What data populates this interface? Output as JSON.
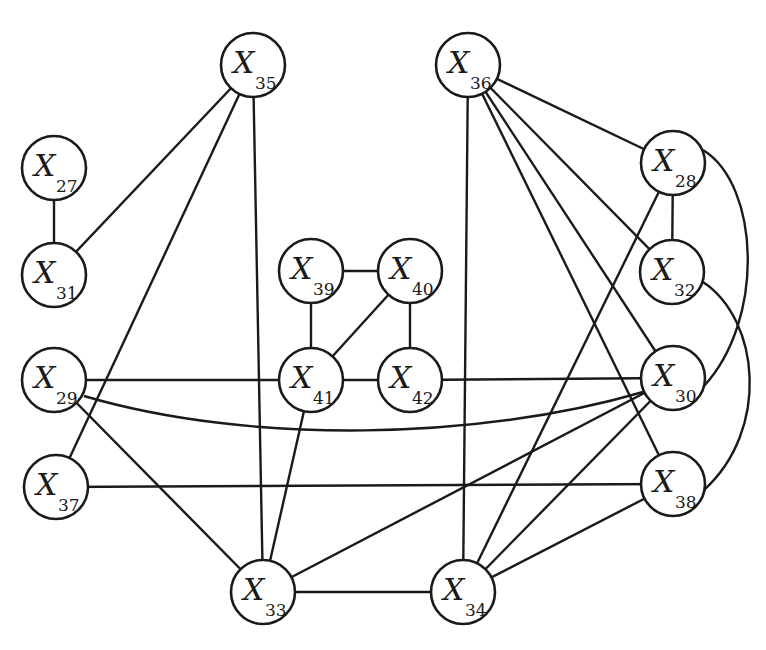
{
  "diagram": {
    "type": "undirected-graph",
    "node_radius": 32,
    "colors": {
      "stroke": "#1a1a1a",
      "fill": "#ffffff",
      "background": "#ffffff"
    },
    "nodes": [
      {
        "id": "X35",
        "var": "X",
        "sub": "35",
        "x": 253,
        "y": 65
      },
      {
        "id": "X36",
        "var": "X",
        "sub": "36",
        "x": 468,
        "y": 65
      },
      {
        "id": "X27",
        "var": "X",
        "sub": "27",
        "x": 54,
        "y": 168
      },
      {
        "id": "X28",
        "var": "X",
        "sub": "28",
        "x": 673,
        "y": 163
      },
      {
        "id": "X31",
        "var": "X",
        "sub": "31",
        "x": 54,
        "y": 275
      },
      {
        "id": "X32",
        "var": "X",
        "sub": "32",
        "x": 672,
        "y": 272
      },
      {
        "id": "X39",
        "var": "X",
        "sub": "39",
        "x": 311,
        "y": 271
      },
      {
        "id": "X40",
        "var": "X",
        "sub": "40",
        "x": 410,
        "y": 271
      },
      {
        "id": "X29",
        "var": "X",
        "sub": "29",
        "x": 54,
        "y": 380
      },
      {
        "id": "X41",
        "var": "X",
        "sub": "41",
        "x": 311,
        "y": 380
      },
      {
        "id": "X42",
        "var": "X",
        "sub": "42",
        "x": 410,
        "y": 380
      },
      {
        "id": "X30",
        "var": "X",
        "sub": "30",
        "x": 673,
        "y": 378
      },
      {
        "id": "X37",
        "var": "X",
        "sub": "37",
        "x": 56,
        "y": 487
      },
      {
        "id": "X38",
        "var": "X",
        "sub": "38",
        "x": 673,
        "y": 484
      },
      {
        "id": "X33",
        "var": "X",
        "sub": "33",
        "x": 263,
        "y": 592
      },
      {
        "id": "X34",
        "var": "X",
        "sub": "34",
        "x": 463,
        "y": 592
      }
    ],
    "edges": [
      {
        "from": "X27",
        "to": "X31"
      },
      {
        "from": "X35",
        "to": "X31"
      },
      {
        "from": "X35",
        "to": "X37"
      },
      {
        "from": "X35",
        "to": "X33"
      },
      {
        "from": "X36",
        "to": "X34"
      },
      {
        "from": "X36",
        "to": "X28"
      },
      {
        "from": "X36",
        "to": "X32"
      },
      {
        "from": "X36",
        "to": "X30"
      },
      {
        "from": "X36",
        "to": "X38"
      },
      {
        "from": "X28",
        "to": "X32"
      },
      {
        "from": "X28",
        "to": "X34"
      },
      {
        "from": "X28",
        "to": "X30",
        "curve": "M 703 150 C 760 185 765 320 704 386"
      },
      {
        "from": "X32",
        "to": "X38",
        "curve": "M 703 282 C 760 320 770 430 704 490"
      },
      {
        "from": "X39",
        "to": "X40"
      },
      {
        "from": "X39",
        "to": "X41"
      },
      {
        "from": "X40",
        "to": "X41"
      },
      {
        "from": "X40",
        "to": "X42"
      },
      {
        "from": "X41",
        "to": "X42"
      },
      {
        "from": "X29",
        "to": "X41"
      },
      {
        "from": "X29",
        "to": "X30",
        "curve": "M 84 396 C 250 445 480 440 643 392"
      },
      {
        "from": "X29",
        "to": "X33"
      },
      {
        "from": "X41",
        "to": "X33"
      },
      {
        "from": "X42",
        "to": "X30"
      },
      {
        "from": "X37",
        "to": "X38"
      },
      {
        "from": "X33",
        "to": "X34"
      },
      {
        "from": "X33",
        "to": "X30"
      },
      {
        "from": "X34",
        "to": "X30"
      },
      {
        "from": "X34",
        "to": "X38"
      }
    ]
  }
}
